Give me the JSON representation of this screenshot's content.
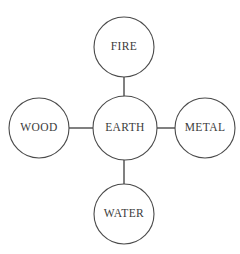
{
  "diagram": {
    "type": "node-link",
    "background_color": "#ffffff",
    "stroke_color": "#4a4a4a",
    "text_color": "#3b3b3b",
    "nodes": [
      {
        "id": "fire",
        "label": "FIRE",
        "position": "top",
        "cx": 124,
        "cy": 47,
        "r": 30
      },
      {
        "id": "wood",
        "label": "WOOD",
        "position": "left",
        "cx": 39,
        "cy": 128,
        "r": 30
      },
      {
        "id": "earth",
        "label": "EARTH",
        "position": "center",
        "cx": 125,
        "cy": 128,
        "r": 32
      },
      {
        "id": "metal",
        "label": "METAL",
        "position": "right",
        "cx": 205,
        "cy": 128,
        "r": 30
      },
      {
        "id": "water",
        "label": "WATER",
        "position": "bottom",
        "cx": 124,
        "cy": 214,
        "r": 30
      }
    ],
    "edges": [
      {
        "id": "fire-earth",
        "from": "fire",
        "to": "earth",
        "x1": 124,
        "y1": 77,
        "x2": 124,
        "y2": 97
      },
      {
        "id": "wood-earth",
        "from": "wood",
        "to": "earth",
        "x1": 69,
        "y1": 128,
        "x2": 93,
        "y2": 128
      },
      {
        "id": "earth-metal",
        "from": "earth",
        "to": "metal",
        "x1": 157,
        "y1": 128,
        "x2": 176,
        "y2": 128
      },
      {
        "id": "earth-water",
        "from": "earth",
        "to": "water",
        "x1": 124,
        "y1": 160,
        "x2": 124,
        "y2": 184
      }
    ]
  }
}
